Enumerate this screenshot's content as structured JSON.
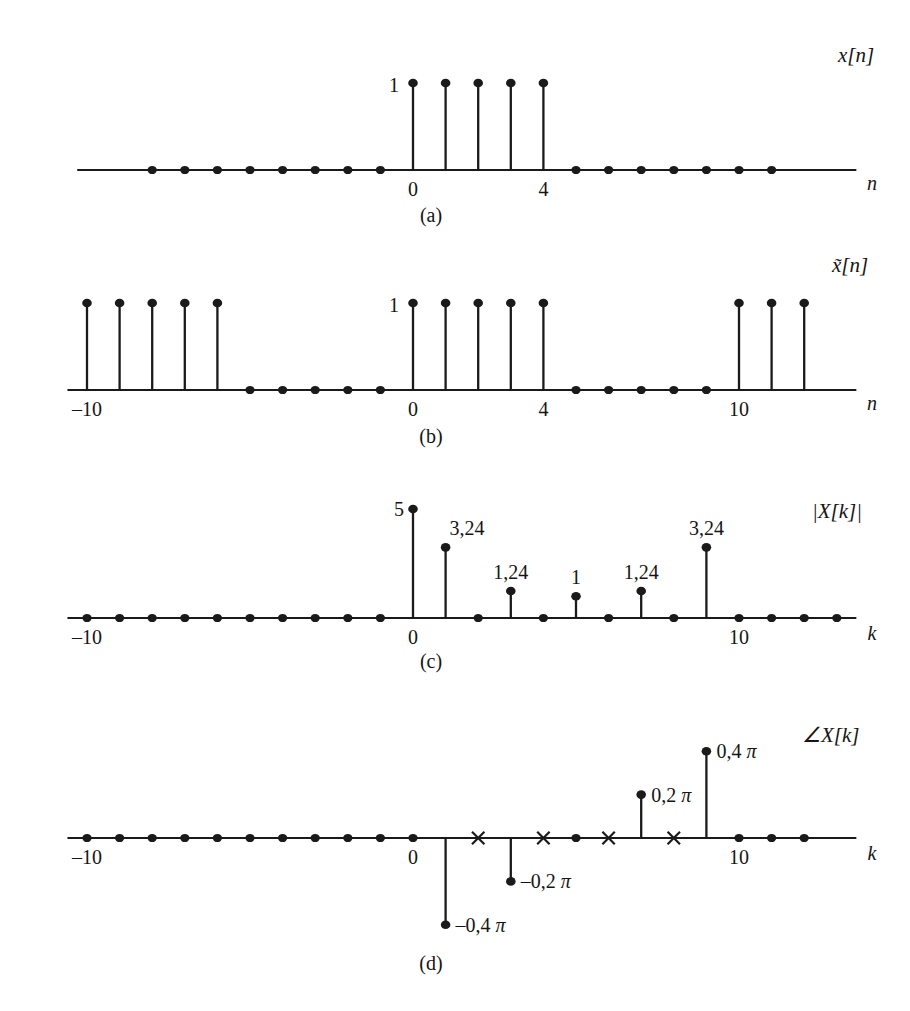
{
  "figure": {
    "background": "#ffffff",
    "ink": "#1a1a1a",
    "origin_x": 413,
    "unit_px": 32.6
  },
  "panels": [
    {
      "id": "a",
      "caption": "(a)",
      "signal_label": "x[n]",
      "signal_label_plain": "x[n]",
      "axis_var": "n",
      "amp_label": "1",
      "tick_labels": [
        {
          "k": 0,
          "text": "0"
        },
        {
          "k": 4,
          "text": "4"
        }
      ],
      "axis_y": 170,
      "caption_y": 222,
      "signal_label_xy": [
        838,
        62
      ],
      "axis_var_xy": [
        872,
        190
      ],
      "amp_label_xy": [
        399,
        92
      ],
      "x_start_k": -10.3,
      "x_end_k": 13.6,
      "stem_top_y": 83,
      "zero_dots_k": [
        -8,
        -7,
        -6,
        -5,
        -4,
        -3,
        -2,
        -1,
        5,
        6,
        7,
        8,
        9,
        10,
        11
      ],
      "stems": [
        {
          "k": 0,
          "value": 1
        },
        {
          "k": 1,
          "value": 1
        },
        {
          "k": 2,
          "value": 1
        },
        {
          "k": 3,
          "value": 1
        },
        {
          "k": 4,
          "value": 1
        }
      ]
    },
    {
      "id": "b",
      "caption": "(b)",
      "signal_label": "x̃[n]",
      "signal_label_plain": "x~[n]",
      "axis_var": "n",
      "amp_label": "1",
      "tick_labels": [
        {
          "k": -10,
          "text": "–10"
        },
        {
          "k": 0,
          "text": "0"
        },
        {
          "k": 4,
          "text": "4"
        },
        {
          "k": 10,
          "text": "10"
        }
      ],
      "axis_y": 390,
      "caption_y": 443,
      "signal_label_xy": [
        832,
        272
      ],
      "axis_var_xy": [
        872,
        410
      ],
      "amp_label_xy": [
        399,
        312
      ],
      "x_start_k": -10.6,
      "x_end_k": 13.6,
      "stem_top_y": 303,
      "zero_dots_k": [
        -5,
        -4,
        -3,
        -2,
        -1,
        5,
        6,
        7,
        8,
        9
      ],
      "stems": [
        {
          "k": -10,
          "value": 1
        },
        {
          "k": -9,
          "value": 1
        },
        {
          "k": -8,
          "value": 1
        },
        {
          "k": -7,
          "value": 1
        },
        {
          "k": -6,
          "value": 1
        },
        {
          "k": 0,
          "value": 1
        },
        {
          "k": 1,
          "value": 1
        },
        {
          "k": 2,
          "value": 1
        },
        {
          "k": 3,
          "value": 1
        },
        {
          "k": 4,
          "value": 1
        },
        {
          "k": 10,
          "value": 1
        },
        {
          "k": 11,
          "value": 1
        },
        {
          "k": 12,
          "value": 1
        }
      ]
    },
    {
      "id": "c",
      "caption": "(c)",
      "signal_label": "|X[k]|",
      "signal_label_plain": "|X[k]|",
      "axis_var": "k",
      "tick_labels": [
        {
          "k": -10,
          "text": "–10"
        },
        {
          "k": 0,
          "text": "0"
        },
        {
          "k": 10,
          "text": "10"
        }
      ],
      "axis_y": 618,
      "caption_y": 668,
      "signal_label_xy": [
        812,
        518
      ],
      "axis_var_xy": [
        872,
        640
      ],
      "x_start_k": -10.6,
      "x_end_k": 13.6,
      "y_scale_px_per_unit": 21.8,
      "zero_dots_k": [
        -10,
        -9,
        -8,
        -7,
        -6,
        -5,
        -4,
        -3,
        -2,
        -1,
        2,
        4,
        6,
        8,
        10,
        11,
        12,
        13
      ],
      "stems": [
        {
          "k": 0,
          "value": 5,
          "label": "5",
          "label_side": "left"
        },
        {
          "k": 1,
          "value": 3.24,
          "label": "3,24",
          "label_side": "right"
        },
        {
          "k": 3,
          "value": 1.24,
          "label": "1,24",
          "label_side": "center"
        },
        {
          "k": 5,
          "value": 1,
          "label": "1",
          "label_side": "center"
        },
        {
          "k": 7,
          "value": 1.24,
          "label": "1,24",
          "label_side": "center"
        },
        {
          "k": 9,
          "value": 3.24,
          "label": "3,24",
          "label_side": "center"
        }
      ]
    },
    {
      "id": "d",
      "caption": "(d)",
      "signal_label": "∠X[k]",
      "signal_label_plain": "angle X[k]",
      "axis_var": "k",
      "tick_labels": [
        {
          "k": -10,
          "text": "–10"
        },
        {
          "k": 0,
          "text": "0"
        },
        {
          "k": 10,
          "text": "10"
        }
      ],
      "axis_y": 838,
      "caption_y": 970,
      "signal_label_xy": [
        802,
        742
      ],
      "axis_var_xy": [
        872,
        860
      ],
      "x_start_k": -10.6,
      "x_end_k": 13.6,
      "y_scale_px_per_unit": 217,
      "zero_dots_k": [
        -10,
        -9,
        -8,
        -7,
        -6,
        -5,
        -4,
        -3,
        -2,
        -1,
        0,
        5,
        10,
        11,
        12
      ],
      "cross_marks_k": [
        2,
        4,
        6,
        8
      ],
      "stems": [
        {
          "k": 1,
          "value": -0.4,
          "label": "–0,4",
          "pi": "π",
          "label_side": "right"
        },
        {
          "k": 3,
          "value": -0.2,
          "label": "–0,2",
          "pi": "π",
          "label_side": "right"
        },
        {
          "k": 7,
          "value": 0.2,
          "label": "0,2",
          "pi": "π",
          "label_side": "right"
        },
        {
          "k": 9,
          "value": 0.4,
          "label": "0,4",
          "pi": "π",
          "label_side": "right"
        }
      ]
    }
  ],
  "chart_data": {
    "type": "line",
    "subplots": [
      {
        "panel": "(a)",
        "type": "stem",
        "title": "x[n]",
        "xlabel": "n",
        "ylabel": "x[n]",
        "xlim": [
          -10,
          13
        ],
        "ylim": [
          0,
          1.1
        ],
        "x": [
          -8,
          -7,
          -6,
          -5,
          -4,
          -3,
          -2,
          -1,
          0,
          1,
          2,
          3,
          4,
          5,
          6,
          7,
          8,
          9,
          10,
          11
        ],
        "values": [
          0,
          0,
          0,
          0,
          0,
          0,
          0,
          0,
          1,
          1,
          1,
          1,
          1,
          0,
          0,
          0,
          0,
          0,
          0,
          0
        ],
        "tick_labels": [
          "0",
          "4"
        ],
        "annotations": [
          "1"
        ],
        "grid": false,
        "legend": "none"
      },
      {
        "panel": "(b)",
        "type": "stem",
        "title": "x̃[n]",
        "xlabel": "n",
        "ylabel": "x̃[n]",
        "xlim": [
          -10,
          13
        ],
        "ylim": [
          0,
          1.1
        ],
        "x": [
          -10,
          -9,
          -8,
          -7,
          -6,
          -5,
          -4,
          -3,
          -2,
          -1,
          0,
          1,
          2,
          3,
          4,
          5,
          6,
          7,
          8,
          9,
          10,
          11,
          12
        ],
        "values": [
          1,
          1,
          1,
          1,
          1,
          0,
          0,
          0,
          0,
          0,
          1,
          1,
          1,
          1,
          1,
          0,
          0,
          0,
          0,
          0,
          1,
          1,
          1
        ],
        "tick_labels": [
          "–10",
          "0",
          "4",
          "10"
        ],
        "annotations": [
          "1"
        ],
        "grid": false,
        "legend": "none"
      },
      {
        "panel": "(c)",
        "type": "stem",
        "title": "|X[k]|",
        "xlabel": "k",
        "ylabel": "|X[k]|",
        "xlim": [
          -10,
          13
        ],
        "ylim": [
          0,
          5.5
        ],
        "x": [
          -10,
          -9,
          -8,
          -7,
          -6,
          -5,
          -4,
          -3,
          -2,
          -1,
          0,
          1,
          2,
          3,
          4,
          5,
          6,
          7,
          8,
          9,
          10,
          11,
          12,
          13
        ],
        "values": [
          0,
          0,
          0,
          0,
          0,
          0,
          0,
          0,
          0,
          0,
          5,
          3.24,
          0,
          1.24,
          0,
          1,
          0,
          1.24,
          0,
          3.24,
          0,
          0,
          0,
          0
        ],
        "data_labels": [
          "5",
          "3,24",
          "1,24",
          "1",
          "1,24",
          "3,24"
        ],
        "tick_labels": [
          "–10",
          "0",
          "10"
        ],
        "grid": false,
        "legend": "none"
      },
      {
        "panel": "(d)",
        "type": "stem",
        "title": "∠X[k]",
        "xlabel": "k",
        "ylabel": "∠X[k] (radians, units of π)",
        "xlim": [
          -10,
          13
        ],
        "ylim": [
          -0.5,
          0.5
        ],
        "x": [
          -10,
          -9,
          -8,
          -7,
          -6,
          -5,
          -4,
          -3,
          -2,
          -1,
          0,
          1,
          2,
          3,
          4,
          5,
          6,
          7,
          8,
          9,
          10,
          11,
          12
        ],
        "values": [
          0,
          0,
          0,
          0,
          0,
          0,
          0,
          0,
          0,
          0,
          0,
          -0.4,
          null,
          -0.2,
          null,
          0,
          null,
          0.2,
          null,
          0.4,
          0,
          0,
          0
        ],
        "undefined_at": [
          2,
          4,
          6,
          8
        ],
        "undefined_marker": "x",
        "data_labels": [
          "–0,4 π",
          "–0,2 π",
          "0,2 π",
          "0,4 π"
        ],
        "tick_labels": [
          "–10",
          "0",
          "10"
        ],
        "grid": false,
        "legend": "none"
      }
    ]
  }
}
